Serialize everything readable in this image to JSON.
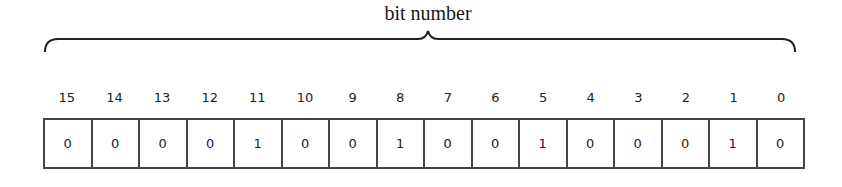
{
  "label": "bit number",
  "bit_numbers": [
    "15",
    "14",
    "13",
    "12",
    "11",
    "10",
    "9",
    "8",
    "7",
    "6",
    "5",
    "4",
    "3",
    "2",
    "1",
    "0"
  ],
  "bit_values": [
    "0",
    "0",
    "0",
    "0",
    "1",
    "0",
    "0",
    "1",
    "0",
    "0",
    "1",
    "0",
    "0",
    "0",
    "1",
    "0"
  ],
  "colors": {
    "line": "#444444",
    "text": "#222222"
  }
}
